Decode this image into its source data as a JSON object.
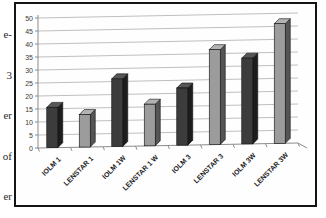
{
  "margin_fragments": [
    "e-",
    "3",
    "er",
    "of",
    "er"
  ],
  "chart_data": {
    "type": "bar",
    "style": "3d-column",
    "title": "",
    "xlabel": "",
    "ylabel": "",
    "categories": [
      "IOLM 1",
      "LENSTAR 1",
      "IOLM 1W",
      "LENSTAR 1 W",
      "IOLM 3",
      "LENSTAR 3",
      "IOLM 3W",
      "LENSTAR 3W"
    ],
    "values": [
      15.5,
      12.5,
      26,
      16,
      22,
      36.5,
      33,
      46
    ],
    "point_styles": [
      "dark",
      "light",
      "dark",
      "light",
      "dark",
      "light",
      "dark",
      "light"
    ],
    "palette": {
      "dark": {
        "front": "#3c3c3c",
        "top": "#565656",
        "side": "#1d1d1d",
        "outline": "#0d0d0d"
      },
      "light": {
        "front": "#9c9c9c",
        "top": "#b3b3b3",
        "side": "#555555",
        "outline": "#0d0d0d"
      }
    },
    "ylim": [
      0,
      50
    ],
    "yticks": [
      0,
      5,
      10,
      15,
      20,
      25,
      30,
      35,
      40,
      45,
      50
    ],
    "grid": true,
    "legend": false,
    "gridline_color": "#b8b8b8",
    "axis_color": "#8c8c8c",
    "tick_label_color": "#3a3a3a",
    "category_label_color": "#1f1f1f",
    "frame_color": "#141414",
    "background": "#fefefe"
  }
}
